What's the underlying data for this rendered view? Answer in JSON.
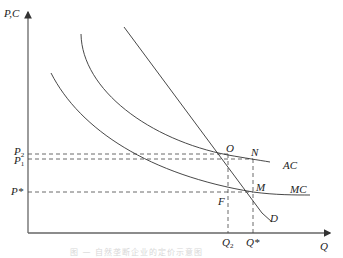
{
  "axes": {
    "y_label": "P,C",
    "x_label": "Q"
  },
  "price_labels": {
    "p2": "P",
    "p2_sub": "2",
    "p1": "P",
    "p1_sub": "1",
    "pstar": "P*"
  },
  "quantity_labels": {
    "q2": "Q",
    "q2_sub": "2",
    "qstar": "Q*"
  },
  "points": {
    "O": "O",
    "N": "N",
    "M": "M",
    "F": "F"
  },
  "curves": {
    "ac": "AC",
    "mc": "MC",
    "d": "D"
  },
  "caption": "图 — 自然垄断企业的定价示意图",
  "colors": {
    "axis": "#555555",
    "curve": "#333333",
    "dashed": "#444444",
    "text": "#222222"
  }
}
